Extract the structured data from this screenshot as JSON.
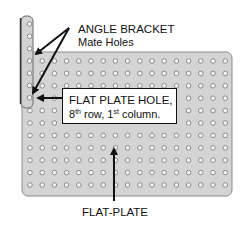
{
  "diagram": {
    "labels": {
      "angle_bracket_title": "ANGLE BRACKET",
      "angle_bracket_sub": "Mate Holes",
      "callout_line1": "FLAT PLATE HOLE,",
      "callout_row_num": "8",
      "callout_row_sup": "th",
      "callout_row_text": " row, 1",
      "callout_col_sup": "st",
      "callout_col_text": " column.",
      "flat_plate": "FLAT-PLATE"
    },
    "plate": {
      "rows": 11,
      "columns": 17,
      "fill": "#d4d4d4",
      "border": "#8a8a8a"
    },
    "bracket": {
      "holes": 7,
      "fill": "#d0d0d0",
      "border": "#555555"
    },
    "colors": {
      "hole_ring": "#8c8c8c",
      "hole_center": "#f4f4f4",
      "arrow": "#111111"
    }
  }
}
